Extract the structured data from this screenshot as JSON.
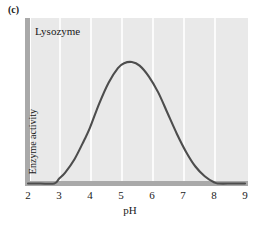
{
  "figure": {
    "panel_label": "(c)",
    "background_color": "#ffffff",
    "plot_background_color": "#e9e9e9",
    "gridline_color": "#fbfbfb",
    "axis_bar_color": "#a9a9a9",
    "curve_color": "#4d4d4d"
  },
  "chart_data": {
    "type": "line",
    "title": "Lysozyme",
    "xlabel": "pH",
    "ylabel": "Enzyme activity",
    "xlim": [
      2,
      9
    ],
    "ylim": [
      0,
      1
    ],
    "xticks": [
      2,
      3,
      4,
      5,
      6,
      7,
      8,
      9
    ],
    "xtick_labels": [
      "2",
      "3",
      "4",
      "5",
      "6",
      "7",
      "8",
      "9"
    ],
    "yticks": [],
    "ytick_labels": [],
    "grid": "vertical gridlines at pH 3,4,5,6,7,8",
    "legend": "none",
    "annotations": [
      "Lysozyme"
    ],
    "series": [
      {
        "name": "Lysozyme",
        "x": [
          2.0,
          2.4,
          2.85,
          3.0,
          3.2,
          3.5,
          3.8,
          4.0,
          4.3,
          4.6,
          4.9,
          5.1,
          5.35,
          5.6,
          5.9,
          6.2,
          6.5,
          6.8,
          7.1,
          7.4,
          7.7,
          8.0,
          8.15,
          8.6,
          9.0
        ],
        "y": [
          0.0,
          0.0,
          0.0,
          0.04,
          0.09,
          0.2,
          0.35,
          0.46,
          0.66,
          0.83,
          0.95,
          0.99,
          1.0,
          0.97,
          0.88,
          0.75,
          0.58,
          0.41,
          0.26,
          0.14,
          0.06,
          0.01,
          0.0,
          0.0,
          0.0
        ]
      }
    ]
  },
  "ticks": [
    {
      "label": "2",
      "x_px": 28
    },
    {
      "label": "3",
      "x_px": 59
    },
    {
      "label": "4",
      "x_px": 90
    },
    {
      "label": "5",
      "x_px": 121
    },
    {
      "label": "6",
      "x_px": 152
    },
    {
      "label": "7",
      "x_px": 183
    },
    {
      "label": "8",
      "x_px": 214
    },
    {
      "label": "9",
      "x_px": 245
    }
  ]
}
